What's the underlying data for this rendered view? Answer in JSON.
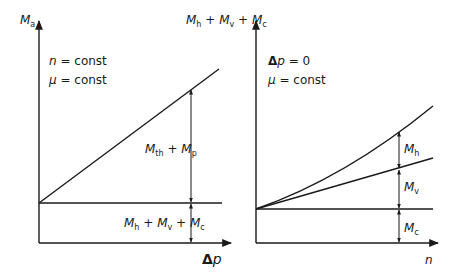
{
  "left_chart": {
    "y_axis_label": {
      "sym": "M",
      "sub": "a"
    },
    "x_axis_label": {
      "delta": "Δ",
      "var": "p"
    },
    "conditions": [
      {
        "var": "n",
        "rest": " = const"
      },
      {
        "var": "μ",
        "rest": " = const"
      }
    ],
    "segment_upper": {
      "t1": "M",
      "s1": "th",
      "plus": " + ",
      "t2": "M",
      "s2": "p"
    },
    "segment_lower": {
      "t1": "M",
      "s1": "h",
      "p1": " + ",
      "t2": "M",
      "s2": "v",
      "p2": " + ",
      "t3": "M",
      "s3": "c"
    }
  },
  "right_chart": {
    "y_axis_label": {
      "t1": "M",
      "s1": "h",
      "p1": " + ",
      "t2": "M",
      "s2": "v",
      "p2": " + ",
      "t3": "M",
      "s3": "c"
    },
    "x_axis_label": {
      "var": "n"
    },
    "conditions": [
      {
        "delta": "Δ",
        "var": "p",
        "rest": " = 0"
      },
      {
        "var": "μ",
        "rest": " = const"
      }
    ],
    "segments": [
      {
        "sym": "M",
        "sub": "h"
      },
      {
        "sym": "M",
        "sub": "v"
      },
      {
        "sym": "M",
        "sub": "c"
      }
    ]
  },
  "colors": {
    "line": "#1a1a1a",
    "background": "#ffffff"
  }
}
